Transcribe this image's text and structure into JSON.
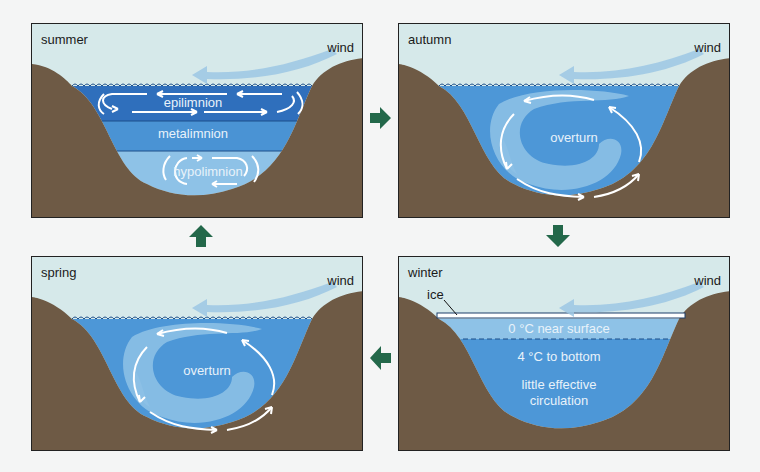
{
  "colors": {
    "sky": "#d6e9ea",
    "terrain": "#6e5a45",
    "water_deep": "#2f74bf",
    "water_mid": "#4d97d7",
    "water_light": "#8cc0e6",
    "wind_arrow": "#9cc7e4",
    "cycle_arrow": "#23684a",
    "frame": "#222222"
  },
  "panels": {
    "summer": {
      "season": "summer",
      "wind": "wind",
      "layers": [
        "epilimnion",
        "metalimnion",
        "hypolimnion"
      ]
    },
    "autumn": {
      "season": "autumn",
      "wind": "wind",
      "circulation": "overturn"
    },
    "spring": {
      "season": "spring",
      "wind": "wind",
      "circulation": "overturn"
    },
    "winter": {
      "season": "winter",
      "wind": "wind",
      "ice": "ice",
      "surface": "0 °C near surface",
      "bottom": "4 °C to bottom",
      "note_line1": "little effective",
      "note_line2": "circulation"
    }
  },
  "cycle": [
    {
      "from": "summer",
      "to": "autumn",
      "direction": "right"
    },
    {
      "from": "autumn",
      "to": "winter",
      "direction": "down"
    },
    {
      "from": "winter",
      "to": "spring",
      "direction": "left"
    },
    {
      "from": "spring",
      "to": "summer",
      "direction": "up"
    }
  ]
}
